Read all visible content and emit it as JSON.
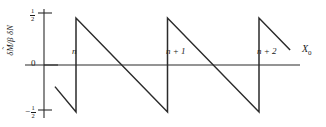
{
  "figure": {
    "background_color": "#ffffff",
    "line_color": "#2b2b2b",
    "axis_color": "#2b2b2b"
  },
  "axes": {
    "y_label_parts": {
      "delta1": "δ",
      "m": "M",
      "tilde": "˜",
      "slash_beta": "/β ",
      "delta2": "δ",
      "n": "N"
    },
    "y_label_text": "δM̃/β δN",
    "x_label": "X",
    "x_label_subscript": "0",
    "y_ticks": [
      {
        "name": "half-positive",
        "numerator": "1",
        "denominator": "2",
        "sign": "",
        "value": 0.5
      },
      {
        "name": "zero",
        "text": "0",
        "value": 0
      },
      {
        "name": "half-negative",
        "numerator": "1",
        "denominator": "2",
        "sign": "−",
        "value": -0.5
      }
    ],
    "x_ticks": [
      {
        "name": "n",
        "label": "n",
        "value": 0
      },
      {
        "name": "n-plus-1",
        "label": "n + 1",
        "value": 1
      },
      {
        "name": "n-plus-2",
        "label": "n + 2",
        "value": 2
      }
    ]
  },
  "chart_data": {
    "type": "line",
    "title": "",
    "subtitle": "",
    "xlabel": "X0",
    "ylabel": "δM̃/β δN",
    "xlim": [
      -0.23,
      2.56
    ],
    "ylim": [
      -0.5,
      0.5
    ],
    "grid": false,
    "legend": null,
    "waveform": {
      "shape": "sawtooth",
      "period": 1.0,
      "amplitude_max": 0.5,
      "amplitude_min": -0.5,
      "slope_per_unit": -1.0,
      "discontinuity_positions": [
        0,
        1,
        2
      ],
      "x_start": -0.23,
      "x_end": 2.34
    },
    "segments": [
      {
        "name": "partial-leading-ramp",
        "x": [
          -0.23,
          0.0
        ],
        "y": [
          -0.23,
          -0.5
        ]
      },
      {
        "name": "jump-at-n",
        "x": [
          0.0,
          0.0
        ],
        "y": [
          -0.5,
          0.5
        ]
      },
      {
        "name": "ramp-n-to-n1",
        "x": [
          0.0,
          1.0
        ],
        "y": [
          0.5,
          -0.5
        ]
      },
      {
        "name": "jump-at-n1",
        "x": [
          1.0,
          1.0
        ],
        "y": [
          -0.5,
          0.5
        ]
      },
      {
        "name": "ramp-n1-to-n2",
        "x": [
          1.0,
          2.0
        ],
        "y": [
          0.5,
          -0.5
        ]
      },
      {
        "name": "jump-at-n2",
        "x": [
          2.0,
          2.0
        ],
        "y": [
          -0.5,
          0.5
        ]
      },
      {
        "name": "partial-trailing-ramp",
        "x": [
          2.0,
          2.34
        ],
        "y": [
          0.5,
          0.16
        ]
      }
    ],
    "x": [
      -0.23,
      0.0,
      0.0,
      1.0,
      1.0,
      2.0,
      2.0,
      2.34
    ],
    "values": [
      -0.23,
      -0.5,
      0.5,
      -0.5,
      0.5,
      -0.5,
      0.5,
      0.16
    ]
  }
}
